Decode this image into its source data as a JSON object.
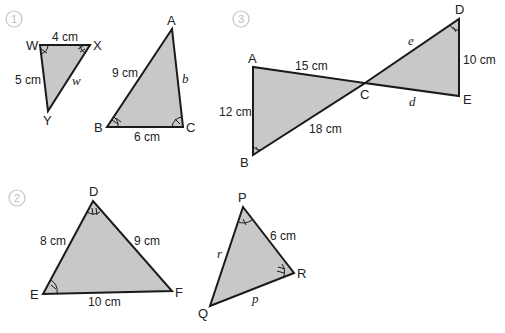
{
  "problems": [
    {
      "number": "1",
      "triangles": [
        {
          "vertices": {
            "W": "W",
            "X": "X",
            "Y": "Y"
          },
          "sides": {
            "WX": "4 cm",
            "WY": "5 cm",
            "XY": "w"
          }
        },
        {
          "vertices": {
            "A": "A",
            "B": "B",
            "C": "C"
          },
          "sides": {
            "AB": "9 cm",
            "AC": "b",
            "BC": "6 cm"
          }
        }
      ]
    },
    {
      "number": "2",
      "triangles": [
        {
          "vertices": {
            "D": "D",
            "E": "E",
            "F": "F"
          },
          "sides": {
            "DE": "8 cm",
            "DF": "9 cm",
            "EF": "10 cm"
          }
        },
        {
          "vertices": {
            "P": "P",
            "Q": "Q",
            "R": "R"
          },
          "sides": {
            "PR": "6 cm",
            "PQ": "r",
            "QR": "p"
          }
        }
      ]
    },
    {
      "number": "3",
      "triangles": [
        {
          "vertices": {
            "A": "A",
            "B": "B",
            "C": "C"
          },
          "sides": {
            "AC": "15 cm",
            "AB": "12 cm",
            "BC": "18 cm"
          }
        },
        {
          "vertices": {
            "D": "D",
            "E": "E"
          },
          "sides": {
            "CD": "e",
            "DE": "10 cm",
            "CE": "d"
          }
        }
      ]
    }
  ],
  "colors": {
    "fill": "#c8c8c8",
    "stroke": "#1a1a1a",
    "number_circle": "#c4c4c4"
  }
}
